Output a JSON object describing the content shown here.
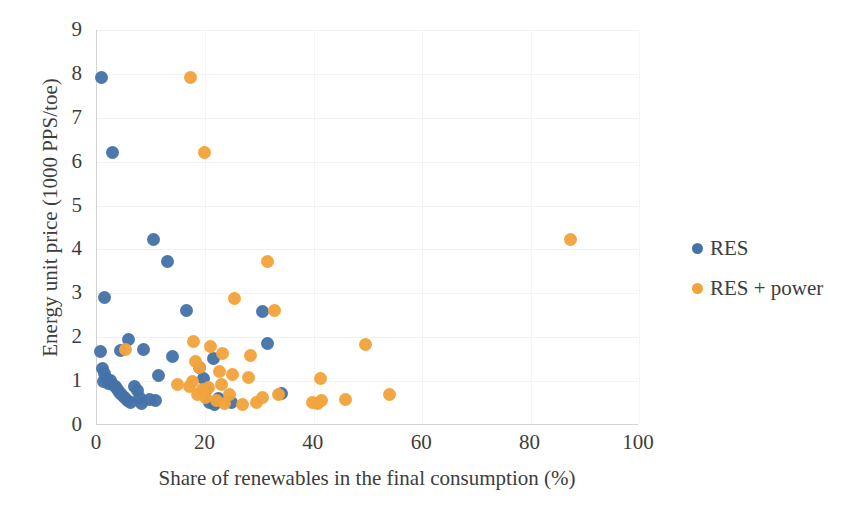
{
  "chart_data": {
    "type": "scatter",
    "title": "",
    "xlabel": "Share of renewables in the final consumption (%)",
    "ylabel": "Energy unit price (1000 PPS/toe)",
    "xlim": [
      0,
      100
    ],
    "ylim": [
      0,
      9
    ],
    "xticks": [
      0,
      20,
      40,
      60,
      80,
      100
    ],
    "yticks": [
      0,
      1,
      2,
      3,
      4,
      5,
      6,
      7,
      8,
      9
    ],
    "grid": true,
    "legend_position": "right",
    "colors": {
      "res": "#4573a8",
      "res_power": "#f2a33c",
      "axis": "#d3d3d3",
      "gridline": "#f2f2f2",
      "text": "#3d3d3d"
    },
    "series": [
      {
        "name": "RES",
        "color": "#4573a8",
        "points": [
          [
            0.8,
            7.92
          ],
          [
            2.8,
            6.2
          ],
          [
            1.3,
            2.9
          ],
          [
            0.6,
            1.68
          ],
          [
            10.5,
            4.23
          ],
          [
            13.0,
            3.72
          ],
          [
            16.5,
            2.62
          ],
          [
            30.5,
            2.58
          ],
          [
            5.8,
            1.95
          ],
          [
            8.6,
            1.72
          ],
          [
            4.3,
            1.7
          ],
          [
            14.0,
            1.57
          ],
          [
            21.5,
            1.52
          ],
          [
            31.5,
            1.85
          ],
          [
            1.0,
            1.28
          ],
          [
            1.4,
            1.18
          ],
          [
            1.7,
            1.05
          ],
          [
            1.2,
            0.98
          ],
          [
            2.1,
            0.95
          ],
          [
            2.4,
            1.02
          ],
          [
            2.9,
            0.92
          ],
          [
            3.4,
            0.88
          ],
          [
            3.8,
            0.8
          ],
          [
            4.2,
            0.75
          ],
          [
            4.6,
            0.7
          ],
          [
            5.1,
            0.62
          ],
          [
            5.6,
            0.56
          ],
          [
            6.2,
            0.52
          ],
          [
            7.0,
            0.88
          ],
          [
            7.4,
            0.78
          ],
          [
            7.9,
            0.62
          ],
          [
            8.3,
            0.49
          ],
          [
            9.6,
            0.58
          ],
          [
            10.8,
            0.56
          ],
          [
            11.4,
            1.12
          ],
          [
            19.0,
            1.32
          ],
          [
            19.6,
            1.05
          ],
          [
            20.2,
            0.82
          ],
          [
            20.8,
            0.52
          ],
          [
            21.6,
            0.46
          ],
          [
            22.4,
            0.6
          ],
          [
            24.8,
            0.52
          ],
          [
            34.0,
            0.72
          ]
        ]
      },
      {
        "name": "RES + power",
        "color": "#f2a33c",
        "points": [
          [
            17.3,
            7.92
          ],
          [
            19.8,
            6.2
          ],
          [
            87.4,
            4.23
          ],
          [
            31.5,
            3.72
          ],
          [
            25.4,
            2.88
          ],
          [
            32.8,
            2.6
          ],
          [
            5.2,
            1.72
          ],
          [
            17.8,
            1.9
          ],
          [
            21.0,
            1.78
          ],
          [
            23.2,
            1.62
          ],
          [
            28.3,
            1.58
          ],
          [
            49.5,
            1.84
          ],
          [
            18.2,
            1.45
          ],
          [
            19.0,
            1.3
          ],
          [
            22.6,
            1.22
          ],
          [
            25.0,
            1.15
          ],
          [
            28.0,
            1.08
          ],
          [
            41.2,
            1.05
          ],
          [
            14.8,
            0.92
          ],
          [
            17.0,
            0.88
          ],
          [
            17.6,
            1.0
          ],
          [
            19.4,
            0.8
          ],
          [
            20.6,
            0.85
          ],
          [
            23.0,
            0.92
          ],
          [
            24.4,
            0.7
          ],
          [
            29.5,
            0.52
          ],
          [
            30.5,
            0.62
          ],
          [
            33.5,
            0.7
          ],
          [
            39.8,
            0.52
          ],
          [
            40.6,
            0.5
          ],
          [
            41.4,
            0.56
          ],
          [
            45.8,
            0.58
          ],
          [
            54.0,
            0.7
          ],
          [
            18.6,
            0.7
          ],
          [
            20.0,
            0.62
          ],
          [
            22.0,
            0.56
          ],
          [
            23.6,
            0.48
          ],
          [
            26.8,
            0.46
          ]
        ]
      }
    ]
  },
  "legend": {
    "items": [
      {
        "label": "RES",
        "key": "res"
      },
      {
        "label": "RES + power",
        "key": "respower"
      }
    ]
  }
}
